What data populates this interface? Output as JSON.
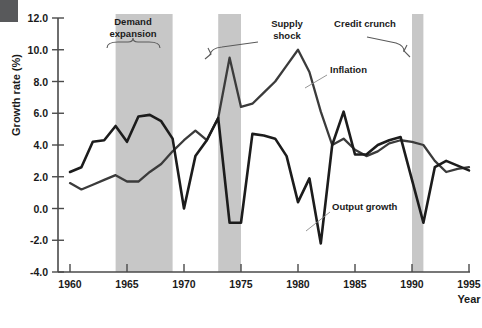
{
  "chart_data": {
    "type": "line",
    "title": "",
    "xlabel": "Year",
    "ylabel": "Growth rate (%)",
    "xlim": [
      1960,
      1995
    ],
    "ylim": [
      -4.0,
      12.0
    ],
    "grid": false,
    "legend": "inline-annotations",
    "x": [
      1960,
      1961,
      1962,
      1963,
      1964,
      1965,
      1966,
      1967,
      1968,
      1969,
      1970,
      1971,
      1972,
      1973,
      1974,
      1975,
      1976,
      1977,
      1978,
      1979,
      1980,
      1981,
      1982,
      1983,
      1984,
      1985,
      1986,
      1987,
      1988,
      1989,
      1990,
      1991,
      1992,
      1993,
      1994,
      1995
    ],
    "xticks": [
      1960,
      1965,
      1970,
      1975,
      1980,
      1985,
      1990,
      1995
    ],
    "yticks": [
      -4.0,
      -2.0,
      0.0,
      2.0,
      4.0,
      6.0,
      8.0,
      10.0,
      12.0
    ],
    "series": [
      {
        "name": "Output growth",
        "color": "#1c1c1c",
        "values": [
          2.3,
          2.6,
          4.2,
          4.3,
          5.2,
          4.2,
          5.8,
          5.9,
          5.5,
          4.4,
          0.0,
          3.3,
          4.3,
          5.7,
          -0.9,
          -0.9,
          4.7,
          4.6,
          4.4,
          3.3,
          0.4,
          1.9,
          -2.2,
          4.0,
          6.1,
          3.4,
          3.4,
          4.0,
          4.3,
          4.5,
          1.8,
          -0.9,
          2.6,
          3.0,
          2.7,
          2.4
        ]
      },
      {
        "name": "Inflation",
        "color": "#3b3b3b",
        "values": [
          1.6,
          1.2,
          1.5,
          1.8,
          2.1,
          1.7,
          1.7,
          2.3,
          2.8,
          3.6,
          4.3,
          4.9,
          4.3,
          5.7,
          9.5,
          6.4,
          6.6,
          7.3,
          8.0,
          9.0,
          10.0,
          8.6,
          6.1,
          4.0,
          4.4,
          3.7,
          3.3,
          3.6,
          4.1,
          4.3,
          4.2,
          4.0,
          3.0,
          2.3,
          2.5,
          2.6
        ]
      }
    ],
    "bands": [
      {
        "name": "Demand expansion",
        "start": 1964,
        "end": 1969,
        "color": "#c7c7c7"
      },
      {
        "name": "Supply shock",
        "start": 1973,
        "end": 1975,
        "color": "#c7c7c7"
      },
      {
        "name": "Credit crunch",
        "start": 1990,
        "end": 1991,
        "color": "#c7c7c7"
      }
    ],
    "annotations": [
      {
        "label_line1": "Demand",
        "label_line2": "expansion"
      },
      {
        "label_line1": "Supply",
        "label_line2": "shock"
      },
      {
        "label_line1": "Credit crunch",
        "label_line2": ""
      },
      {
        "label_line1": "Inflation",
        "label_line2": ""
      },
      {
        "label_line1": "Output growth",
        "label_line2": ""
      }
    ]
  },
  "axes": {
    "y_title": "Growth rate (%)",
    "x_title": "Year",
    "y_tick_labels": [
      "12.0",
      "10.0",
      "8.0",
      "6.0",
      "4.0",
      "2.0",
      "0.0",
      "-2.0",
      "-4.0"
    ],
    "x_tick_labels": [
      "1960",
      "1965",
      "1970",
      "1975",
      "1980",
      "1985",
      "1990",
      "1995"
    ]
  },
  "annotations": {
    "demand_line1": "Demand",
    "demand_line2": "expansion",
    "supply_line1": "Supply",
    "supply_line2": "shock",
    "credit": "Credit crunch",
    "inflation": "Inflation",
    "output": "Output growth"
  }
}
